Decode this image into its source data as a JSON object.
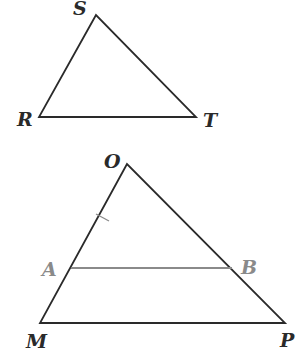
{
  "colors": {
    "line": "#2a2a2a",
    "highlight": "#8a8a8a"
  },
  "triangle_rst": {
    "labels": {
      "S": "S",
      "R": "R",
      "T": "T"
    },
    "points": {
      "S": [
        96,
        15
      ],
      "R": [
        39,
        117
      ],
      "T": [
        196,
        117
      ]
    }
  },
  "triangle_omp": {
    "labels": {
      "O": "O",
      "M": "M",
      "P": "P",
      "A": "A",
      "B": "B"
    },
    "points": {
      "O": [
        127,
        164
      ],
      "M": [
        40,
        323
      ],
      "P": [
        285,
        323
      ],
      "A": [
        71,
        268
      ],
      "B": [
        232,
        268
      ]
    },
    "tick_mark_on": "OA",
    "segment_AB": "parallel to MP"
  }
}
